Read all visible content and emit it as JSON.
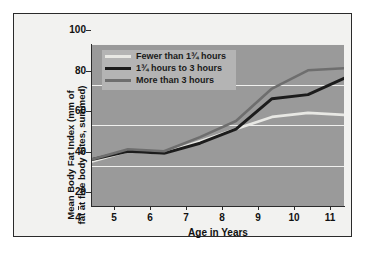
{
  "chart_data": {
    "type": "line",
    "title": "",
    "xlabel": "Age in Years",
    "ylabel": "Mean Body Fat Index (mm of fat at five body sites, summed)",
    "x": [
      4,
      5,
      6,
      7,
      8,
      9,
      10,
      11
    ],
    "xticklabels": [
      "4",
      "5",
      "6",
      "7",
      "8",
      "9",
      "10",
      "11"
    ],
    "yticklabels": [
      "20",
      "40",
      "60",
      "80",
      "100"
    ],
    "yticks": [
      20,
      40,
      60,
      80,
      100
    ],
    "xlim": [
      4,
      11
    ],
    "ylim": [
      20,
      100
    ],
    "grid": true,
    "grid_axis": "y",
    "legend_position": "upper-left-inside",
    "plot_background": "#9a9a9a",
    "gridline_color": "#f0f0ee",
    "series": [
      {
        "name": "Fewer than 1¾ hours",
        "color": "#e8e8e4",
        "values": [
          42,
          47,
          46,
          52,
          58,
          64,
          66,
          65
        ]
      },
      {
        "name": "1¾ hours to 3 hours",
        "color": "#1c1c1c",
        "values": [
          43,
          47,
          46,
          51,
          58,
          73,
          75,
          83
        ]
      },
      {
        "name": "More than 3 hours",
        "color": "#6e6e6e",
        "values": [
          43,
          48,
          47,
          54,
          62,
          78,
          87,
          88
        ]
      }
    ]
  },
  "axis": {
    "x_title": "Age in Years",
    "y_title_line1": "Mean Body Fat Index (mm of",
    "y_title_line2": "fat at five body sites, summed)"
  },
  "legend": {
    "items": [
      {
        "label": "Fewer than 1¾ hours",
        "color": "#e8e8e4"
      },
      {
        "label": "1¾ hours to 3 hours",
        "color": "#1c1c1c"
      },
      {
        "label": "More than 3 hours",
        "color": "#6e6e6e"
      }
    ]
  }
}
